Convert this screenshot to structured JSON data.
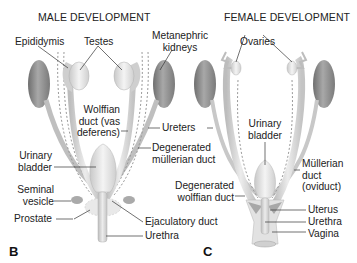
{
  "titles": {
    "male": "MALE DEVELOPMENT",
    "female": "FEMALE DEVELOPMENT"
  },
  "panels": {
    "male": "B",
    "female": "C"
  },
  "male_labels": {
    "epididymis": "Epididymis",
    "testes": "Testes",
    "metanephric_1": "Metanephric",
    "metanephric_2": "kidneys",
    "wolffian_1": "Wolffian",
    "wolffian_2": "duct (vas",
    "wolffian_3": "deferens)",
    "ureters": "Ureters",
    "degen_mullerian_1": "Degenerated",
    "degen_mullerian_2": "müllerian duct",
    "urinary_bladder_1": "Urinary",
    "urinary_bladder_2": "bladder",
    "seminal_1": "Seminal",
    "seminal_2": "vesicle",
    "prostate": "Prostate",
    "ejaculatory": "Ejaculatory duct",
    "urethra": "Urethra"
  },
  "female_labels": {
    "ovaries": "Ovaries",
    "urinary_bladder_1": "Urinary",
    "urinary_bladder_2": "bladder",
    "mullerian_1": "Müllerian",
    "mullerian_2": "duct",
    "mullerian_3": "(oviduct)",
    "degen_wolffian_1": "Degenerated",
    "degen_wolffian_2": "wolffian duct",
    "uterus": "Uterus",
    "urethra": "Urethra",
    "vagina": "Vagina"
  },
  "colors": {
    "kidney": "#8a8a8a",
    "organ": "#e6e6e6",
    "duct": "#d9d9d9",
    "line": "#333333"
  }
}
